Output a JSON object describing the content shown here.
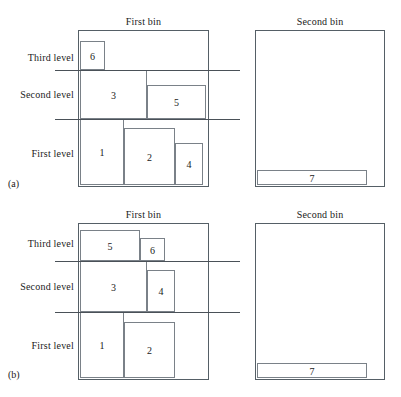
{
  "figure": {
    "type": "bin-packing-diagram",
    "panels": [
      {
        "tag": "(a)",
        "tag_x": 8,
        "tag_y": 178,
        "bins": [
          {
            "name": "first-bin",
            "title": "First bin",
            "title_x": 78,
            "title_y": 16,
            "title_w": 131,
            "x": 78,
            "y": 30,
            "w": 131,
            "h": 157,
            "items": [
              {
                "label": "6",
                "x": 80,
                "y": 41,
                "w": 25,
                "h": 29
              },
              {
                "label": "3",
                "x": 80,
                "y": 70,
                "w": 67,
                "h": 49
              },
              {
                "label": "5",
                "x": 147,
                "y": 85,
                "w": 59,
                "h": 34
              },
              {
                "label": "1",
                "x": 80,
                "y": 119,
                "w": 44,
                "h": 66
              },
              {
                "label": "2",
                "x": 124,
                "y": 128,
                "w": 51,
                "h": 57
              },
              {
                "label": "4",
                "x": 175,
                "y": 143,
                "w": 28,
                "h": 42
              }
            ]
          },
          {
            "name": "second-bin",
            "title": "Second bin",
            "title_x": 255,
            "title_y": 16,
            "title_w": 130,
            "x": 255,
            "y": 30,
            "w": 130,
            "h": 157,
            "items": [
              {
                "label": "7",
                "x": 257,
                "y": 170,
                "w": 110,
                "h": 15
              }
            ]
          }
        ],
        "levels": [
          {
            "label": "Third level",
            "label_x": 4,
            "label_y": 52,
            "label_w": 70
          },
          {
            "label": "Second level",
            "label_x": 4,
            "label_y": 89,
            "label_w": 70
          },
          {
            "label": "First level",
            "label_x": 4,
            "label_y": 148,
            "label_w": 70
          }
        ],
        "dividers": [
          {
            "x": 55,
            "y": 70,
            "w": 185
          },
          {
            "x": 55,
            "y": 119,
            "w": 185
          }
        ]
      },
      {
        "tag": "(b)",
        "tag_x": 8,
        "tag_y": 369,
        "bins": [
          {
            "name": "first-bin",
            "title": "First bin",
            "title_x": 78,
            "title_y": 209,
            "title_w": 131,
            "x": 78,
            "y": 223,
            "w": 131,
            "h": 157,
            "items": [
              {
                "label": "5",
                "x": 80,
                "y": 230,
                "w": 60,
                "h": 31
              },
              {
                "label": "6",
                "x": 140,
                "y": 238,
                "w": 25,
                "h": 23
              },
              {
                "label": "3",
                "x": 80,
                "y": 261,
                "w": 67,
                "h": 51
              },
              {
                "label": "4",
                "x": 147,
                "y": 270,
                "w": 28,
                "h": 42
              },
              {
                "label": "1",
                "x": 80,
                "y": 312,
                "w": 44,
                "h": 66
              },
              {
                "label": "2",
                "x": 124,
                "y": 322,
                "w": 51,
                "h": 56
              }
            ]
          },
          {
            "name": "second-bin",
            "title": "Second bin",
            "title_x": 255,
            "title_y": 209,
            "title_w": 130,
            "x": 255,
            "y": 223,
            "w": 130,
            "h": 157,
            "items": [
              {
                "label": "7",
                "x": 257,
                "y": 363,
                "w": 110,
                "h": 15
              }
            ]
          }
        ],
        "levels": [
          {
            "label": "Third level",
            "label_x": 4,
            "label_y": 238,
            "label_w": 70
          },
          {
            "label": "Second level",
            "label_x": 4,
            "label_y": 281,
            "label_w": 70
          },
          {
            "label": "First level",
            "label_x": 4,
            "label_y": 340,
            "label_w": 70
          }
        ],
        "dividers": [
          {
            "x": 55,
            "y": 261,
            "w": 185
          },
          {
            "x": 55,
            "y": 312,
            "w": 185
          }
        ]
      }
    ]
  }
}
